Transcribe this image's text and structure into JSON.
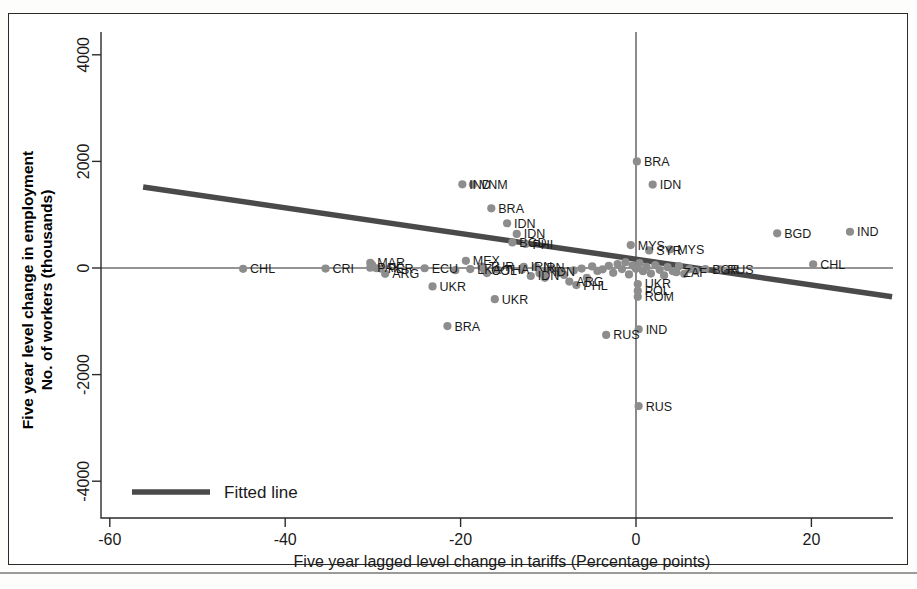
{
  "chart_data": {
    "type": "scatter",
    "title": "",
    "xlabel": "Five year lagged level change in tariffs (Percentage points)",
    "ylabel": "Five year level change in employment\nNo. of workers (thousands)",
    "ylabel_line1": "Five year level change in employment",
    "ylabel_line2": "No. of workers (thousands)",
    "xlim": [
      -66,
      31
    ],
    "ylim": [
      -4600,
      4600
    ],
    "xticks": [
      -60,
      -40,
      -20,
      0,
      20
    ],
    "xticklabels": [
      "-60",
      "-40",
      "-20",
      "0",
      "20"
    ],
    "yticks": [
      -4000,
      -2000,
      0,
      2000,
      4000
    ],
    "yticklabels": [
      "-4000",
      "-2000",
      "0",
      "2000",
      "4000"
    ],
    "grid": false,
    "reference_lines": [
      {
        "axis": "horizontal",
        "value": 0
      },
      {
        "axis": "vertical",
        "value": 0
      }
    ],
    "legend": {
      "position": "bottom-left-inside",
      "entries": [
        {
          "label": "Fitted line",
          "type": "line",
          "color": "#4a4a4a"
        }
      ]
    },
    "marker_color": "#8d8d8d",
    "fitted_line": {
      "label": "Fitted line",
      "color": "#4a4a4a",
      "x_start": -56.2,
      "y_start": 1520,
      "x_end": 29.2,
      "y_end": -540,
      "slope": -24.1,
      "intercept": 166
    },
    "points": [
      {
        "label": "CHL",
        "x": -44.8,
        "y": -15
      },
      {
        "label": "CRI",
        "x": -35.4,
        "y": -10
      },
      {
        "label": "MAR",
        "x": -30.3,
        "y": 95
      },
      {
        "label": "PAK",
        "x": -30.3,
        "y": 5
      },
      {
        "label": "PER",
        "x": -29.1,
        "y": -10
      },
      {
        "label": "ARG",
        "x": -28.6,
        "y": -110
      },
      {
        "label": "ECU",
        "x": -24.1,
        "y": -5
      },
      {
        "label": "UKR",
        "x": -23.2,
        "y": -345
      },
      {
        "label": "BRA",
        "x": -21.5,
        "y": -1090
      },
      {
        "label": "IND",
        "x": -19.8,
        "y": 1570
      },
      {
        "label": "VNM",
        "x": -18.6,
        "y": 1565
      },
      {
        "label": "MEX",
        "x": -19.4,
        "y": 135
      },
      {
        "label": "LKA",
        "x": -18.9,
        "y": -20
      },
      {
        "label": "TUR",
        "x": -17.6,
        "y": 25
      },
      {
        "label": "COL",
        "x": -17.3,
        "y": -40
      },
      {
        "label": "BRA",
        "x": -16.5,
        "y": 1120
      },
      {
        "label": "UKR",
        "x": -16.1,
        "y": -585
      },
      {
        "label": "THA",
        "x": -15.8,
        "y": -30
      },
      {
        "label": "IDN",
        "x": -14.7,
        "y": 840
      },
      {
        "label": "BGD",
        "x": -14.1,
        "y": 480
      },
      {
        "label": "IDN",
        "x": -13.6,
        "y": 640
      },
      {
        "label": "PHI",
        "x": -12.6,
        "y": 450
      },
      {
        "label": "IRN",
        "x": -12.8,
        "y": 20
      },
      {
        "label": "IRN",
        "x": -11.4,
        "y": 15
      },
      {
        "label": "IDN",
        "x": -12.0,
        "y": -150
      },
      {
        "label": "IDN",
        "x": -10.2,
        "y": -60
      },
      {
        "label": "ARG",
        "x": -7.6,
        "y": -255
      },
      {
        "label": "PHL",
        "x": -6.8,
        "y": -320
      },
      {
        "label": "RUS",
        "x": -3.4,
        "y": -1255
      },
      {
        "label": "MYS",
        "x": -0.6,
        "y": 430
      },
      {
        "label": "BRA",
        "x": 0.1,
        "y": 2000
      },
      {
        "label": "IDN",
        "x": 1.9,
        "y": 1565
      },
      {
        "label": "SYR",
        "x": 1.5,
        "y": 330
      },
      {
        "label": "MYS",
        "x": 3.9,
        "y": 350
      },
      {
        "label": "UKR",
        "x": 0.2,
        "y": -300
      },
      {
        "label": "POL",
        "x": 0.2,
        "y": -430
      },
      {
        "label": "ROM",
        "x": 0.2,
        "y": -540
      },
      {
        "label": "IND",
        "x": 0.3,
        "y": -1150
      },
      {
        "label": "RUS",
        "x": 0.3,
        "y": -2590
      },
      {
        "label": "ZAF",
        "x": 4.6,
        "y": -80
      },
      {
        "label": "BGR",
        "x": 7.9,
        "y": -20
      },
      {
        "label": "RUS",
        "x": 9.6,
        "y": -25
      },
      {
        "label": "BGD",
        "x": 16.1,
        "y": 650
      },
      {
        "label": "CHL",
        "x": 20.2,
        "y": 70
      },
      {
        "label": "IND",
        "x": 24.4,
        "y": 680
      },
      {
        "label": "",
        "x": -30.1,
        "y": 60
      },
      {
        "label": "",
        "x": -29.6,
        "y": -5
      },
      {
        "label": "",
        "x": -13.0,
        "y": -30
      },
      {
        "label": "",
        "x": -9.6,
        "y": -15
      },
      {
        "label": "",
        "x": -8.8,
        "y": -95
      },
      {
        "label": "",
        "x": -8.2,
        "y": -130
      },
      {
        "label": "",
        "x": -7.1,
        "y": -45
      },
      {
        "label": "",
        "x": -6.2,
        "y": -10
      },
      {
        "label": "",
        "x": -5.6,
        "y": -185
      },
      {
        "label": "",
        "x": -5.0,
        "y": 30
      },
      {
        "label": "",
        "x": -4.4,
        "y": -55
      },
      {
        "label": "",
        "x": -3.8,
        "y": -25
      },
      {
        "label": "",
        "x": -3.1,
        "y": 40
      },
      {
        "label": "",
        "x": -2.6,
        "y": -90
      },
      {
        "label": "",
        "x": -2.1,
        "y": 75
      },
      {
        "label": "",
        "x": -1.6,
        "y": -20
      },
      {
        "label": "",
        "x": -1.2,
        "y": 110
      },
      {
        "label": "",
        "x": -0.8,
        "y": -120
      },
      {
        "label": "",
        "x": -0.4,
        "y": 45
      },
      {
        "label": "",
        "x": 0.0,
        "y": -15
      },
      {
        "label": "",
        "x": 0.4,
        "y": 90
      },
      {
        "label": "",
        "x": 0.8,
        "y": -60
      },
      {
        "label": "",
        "x": 1.2,
        "y": 20
      },
      {
        "label": "",
        "x": 1.7,
        "y": -105
      },
      {
        "label": "",
        "x": 2.2,
        "y": 55
      },
      {
        "label": "",
        "x": 2.7,
        "y": -35
      },
      {
        "label": "",
        "x": 3.2,
        "y": -140
      },
      {
        "label": "",
        "x": 3.6,
        "y": 15
      },
      {
        "label": "",
        "x": 4.2,
        "y": -60
      },
      {
        "label": "",
        "x": 4.9,
        "y": 35
      },
      {
        "label": "",
        "x": 5.5,
        "y": -110
      },
      {
        "label": "",
        "x": 6.1,
        "y": -20
      },
      {
        "label": "",
        "x": 6.8,
        "y": -55
      },
      {
        "label": "",
        "x": -11.0,
        "y": -100
      },
      {
        "label": "",
        "x": -10.4,
        "y": -185
      },
      {
        "label": "",
        "x": -17.0,
        "y": -95
      },
      {
        "label": "",
        "x": -20.6,
        "y": -40
      }
    ]
  }
}
